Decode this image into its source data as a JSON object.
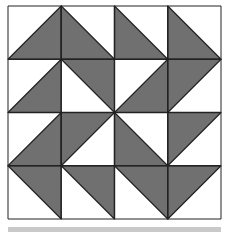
{
  "diagram": {
    "type": "quilt-block",
    "grid": {
      "rows": 4,
      "cols": 4,
      "left": 8,
      "top": 6,
      "cell": 53.25
    },
    "colors": {
      "fill": "#707070",
      "background": "#ffffff",
      "line": "#222222",
      "bar": "#c9c9c9"
    },
    "cells": [
      [
        "BR",
        "BL",
        "BL",
        "BL"
      ],
      [
        "BR",
        "TR",
        "BR",
        "TL"
      ],
      [
        "BR",
        "TL",
        "BL",
        "TL"
      ],
      [
        "TR",
        "TR",
        "TR",
        "TL"
      ]
    ],
    "legend": {
      "BR": "shaded triangle bottom-right (corners BL, TR, BR)",
      "BL": "shaded triangle bottom-left (corners TL, BL, BR)",
      "TR": "shaded triangle top-right (corners TL, TR, BR)",
      "TL": "shaded triangle top-left (corners TL, TR, BL)"
    }
  }
}
